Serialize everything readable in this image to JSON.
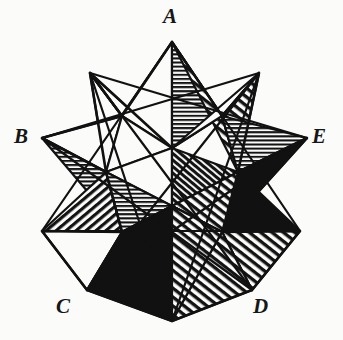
{
  "figure": {
    "name": "small-stellated-dodecahedron",
    "caption": "",
    "background_color": "#fbfbfa",
    "ink_color": "#111111",
    "stroke_width": 2.2,
    "labels": [
      {
        "id": "A",
        "text": "A",
        "x": 172,
        "y": 14
      },
      {
        "id": "B",
        "text": "B",
        "x": 22,
        "y": 134
      },
      {
        "id": "C",
        "text": "C",
        "x": 64,
        "y": 304
      },
      {
        "id": "D",
        "text": "D",
        "x": 261,
        "y": 304
      },
      {
        "id": "E",
        "text": "E",
        "x": 320,
        "y": 134
      }
    ],
    "fills": {
      "white": "#fbfbfa",
      "black": "#111111",
      "hatch_horizontal": "horizontal-line-hatch",
      "hatch_diagonal": "diagonal-line-hatch",
      "hatch_diagonal_dense": "dense-diagonal-line-hatch"
    },
    "geometry": {
      "outer_points": [
        {
          "id": "A",
          "x": 172,
          "y": 42
        },
        {
          "id": "P2",
          "x": 259,
          "y": 73
        },
        {
          "id": "E",
          "x": 307,
          "y": 138
        },
        {
          "id": "P4",
          "x": 300,
          "y": 231
        },
        {
          "id": "D",
          "x": 252,
          "y": 290
        },
        {
          "id": "P6",
          "x": 172,
          "y": 321
        },
        {
          "id": "C",
          "x": 87,
          "y": 290
        },
        {
          "id": "P8",
          "x": 42,
          "y": 231
        },
        {
          "id": "B",
          "x": 42,
          "y": 138
        },
        {
          "id": "P10",
          "x": 90,
          "y": 73
        }
      ],
      "inner_points": [
        {
          "id": "I1",
          "x": 172,
          "y": 148
        },
        {
          "id": "I2",
          "x": 222,
          "y": 116
        },
        {
          "id": "I3",
          "x": 238,
          "y": 172
        },
        {
          "id": "I4",
          "x": 222,
          "y": 232
        },
        {
          "id": "I5",
          "x": 172,
          "y": 206
        },
        {
          "id": "I6",
          "x": 122,
          "y": 232
        },
        {
          "id": "I7",
          "x": 106,
          "y": 172
        },
        {
          "id": "I8",
          "x": 122,
          "y": 116
        }
      ]
    },
    "face_count": 24,
    "spike_count": 10
  }
}
